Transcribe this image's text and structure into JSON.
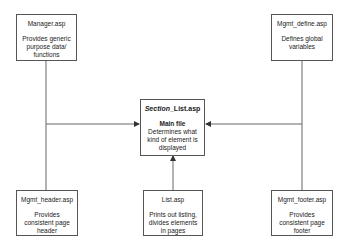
{
  "diagram": {
    "nodes": {
      "manager": {
        "title": "Manager.asp",
        "desc": "Provides generic purpose data/ functions"
      },
      "define": {
        "title": "Mgmt_define.asp",
        "desc": "Defines global variables"
      },
      "main": {
        "title_italic": "Section",
        "title_rest": "_List.asp",
        "subtitle": "Main file",
        "desc": "Determines what kind of element is displayed"
      },
      "header": {
        "title": "Mgmt_header.asp",
        "desc": "Provides consistent page header"
      },
      "list": {
        "title": "List.asp",
        "desc": "Prints out listing, divides elements in pages"
      },
      "footer": {
        "title": "Mgmt_footer.asp",
        "desc": "Provides consistent page footer"
      }
    },
    "edges": [
      {
        "from": "manager",
        "to": "main"
      },
      {
        "from": "header",
        "to": "main"
      },
      {
        "from": "define",
        "to": "main"
      },
      {
        "from": "footer",
        "to": "main"
      },
      {
        "from": "list",
        "to": "main"
      }
    ],
    "colors": {
      "line": "#555555",
      "border": "#555555",
      "background": "#ffffff"
    }
  }
}
